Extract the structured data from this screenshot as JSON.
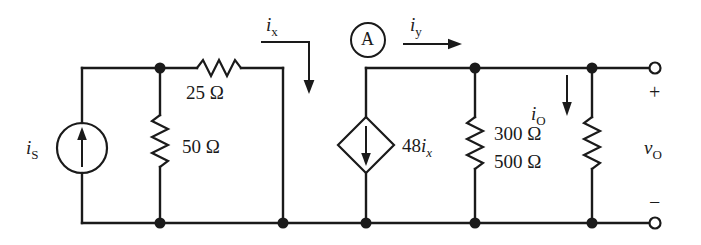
{
  "diagram": {
    "kind": "electrical-schematic",
    "stroke_color": "#1a1a1a",
    "background_color": "#ffffff"
  },
  "components": {
    "source_is": {
      "type": "independent-current-source",
      "symbol": "circle-with-arrow",
      "direction": "up",
      "label_main": "i",
      "label_sub": "S"
    },
    "resistor_25": {
      "type": "resistor",
      "orientation": "horizontal",
      "label": "25 Ω"
    },
    "resistor_50": {
      "type": "resistor",
      "orientation": "vertical",
      "label": "50 Ω"
    },
    "dependent_source": {
      "type": "dependent-current-source",
      "symbol": "diamond-with-arrow",
      "direction": "down",
      "label_gain": "48",
      "label_main": "i",
      "label_sub": "x"
    },
    "ammeter": {
      "type": "ammeter",
      "symbol": "circle",
      "label": "A"
    },
    "resistor_300": {
      "type": "resistor",
      "orientation": "vertical",
      "label": "300 Ω"
    },
    "resistor_500": {
      "type": "resistor",
      "orientation": "vertical",
      "label": "500 Ω"
    }
  },
  "currents": {
    "ix": {
      "main": "i",
      "sub": "x",
      "arrow": "right-then-down"
    },
    "iy": {
      "main": "i",
      "sub": "y",
      "arrow": "right"
    },
    "io": {
      "main": "i",
      "sub": "O",
      "arrow": "down"
    }
  },
  "output_port": {
    "voltage_main": "v",
    "voltage_sub": "O",
    "plus": "+",
    "minus": "−",
    "terminal_shape": "open-circle"
  }
}
